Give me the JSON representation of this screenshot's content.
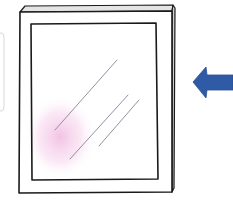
{
  "illustration": {
    "subject": "window-pane",
    "description": "Hand-drawn framed glass pane with glare lines and pink glow, blue arrow pointing left at it",
    "colors": {
      "background": "#ffffff",
      "outline": "#1a1a1a",
      "frame_edge": "#cfcfcf",
      "glare": "#8a8298",
      "glow": "#f0b8e0",
      "arrow": "#2f5aa5",
      "side_bracket": "#d8d8d8"
    },
    "elements": {
      "arrow": {
        "direction": "left"
      },
      "glare_lines": 3
    }
  }
}
